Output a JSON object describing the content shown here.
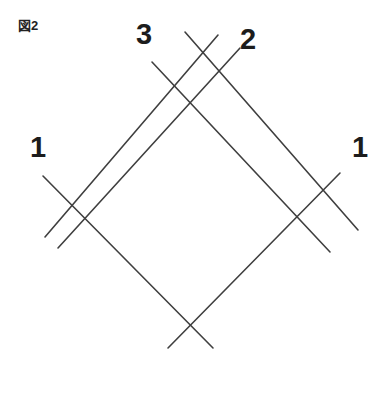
{
  "figure": {
    "caption": "図2",
    "background_color": "#ffffff",
    "stroke_color": "#3f3f3f",
    "stroke_width": 1.6,
    "width": 380,
    "height": 393
  },
  "labels": [
    {
      "id": "left-1",
      "text": "1",
      "x": 30,
      "y": 133
    },
    {
      "id": "top-3",
      "text": "3",
      "x": 136,
      "y": 20
    },
    {
      "id": "top-2",
      "text": "2",
      "x": 240,
      "y": 25
    },
    {
      "id": "right-1",
      "text": "1",
      "x": 352,
      "y": 133
    }
  ],
  "chart_data": {
    "type": "diagram",
    "title": "図2",
    "xlim": [
      0,
      380
    ],
    "ylim": [
      0,
      393
    ],
    "grid": false,
    "legend": "none",
    "lines": [
      {
        "name": "line-left-1",
        "label": "1",
        "direction": "down-right",
        "x1": 43,
        "y1": 176,
        "x2": 213,
        "y2": 348
      },
      {
        "name": "line-3",
        "label": "3",
        "direction": "down-right",
        "x1": 152,
        "y1": 62,
        "x2": 330,
        "y2": 252
      },
      {
        "name": "line-diag-ne",
        "label": "",
        "direction": "down-right",
        "x1": 185,
        "y1": 32,
        "x2": 358,
        "y2": 230
      },
      {
        "name": "line-right-1",
        "label": "1",
        "direction": "down-left",
        "x1": 340,
        "y1": 173,
        "x2": 168,
        "y2": 348
      },
      {
        "name": "line-2",
        "label": "2",
        "direction": "down-left",
        "x1": 240,
        "y1": 48,
        "x2": 58,
        "y2": 248
      },
      {
        "name": "line-diag-nw",
        "label": "",
        "direction": "down-left",
        "x1": 218,
        "y1": 35,
        "x2": 45,
        "y2": 237
      }
    ]
  }
}
